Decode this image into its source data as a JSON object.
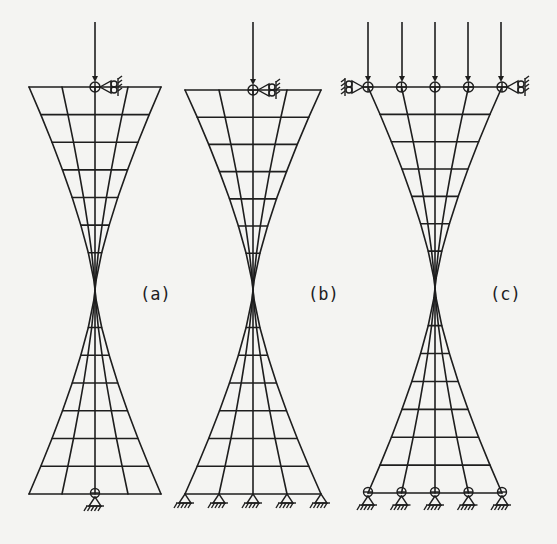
{
  "figure": {
    "panels": [
      {
        "id": "a",
        "label": "(a)",
        "center_x": 95,
        "top_y": 87,
        "waist_y": 290,
        "bottom_y": 494,
        "half_width_top": 66,
        "half_width_bottom": 66,
        "columns": 5,
        "rows_per_half": 7,
        "loads": [
          {
            "x": 95,
            "label": "point-load"
          }
        ],
        "top_support": "roller-right",
        "bottom_supports": "single-pin-center",
        "label_pos": [
          140,
          300
        ]
      },
      {
        "id": "b",
        "label": "(b)",
        "center_x": 253,
        "top_y": 90,
        "waist_y": 290,
        "bottom_y": 494,
        "half_width_top": 68,
        "half_width_bottom": 68,
        "columns": 5,
        "rows_per_half": 7,
        "loads": [
          {
            "x": 253,
            "label": "point-load"
          }
        ],
        "top_support": "roller-right",
        "bottom_supports": "fixed-pins-all-nodes",
        "label_pos": [
          308,
          300
        ]
      },
      {
        "id": "c",
        "label": "(c)",
        "center_x": 435,
        "top_y": 87,
        "waist_y": 288,
        "bottom_y": 493,
        "half_width_top": 67,
        "half_width_bottom": 67,
        "columns": 5,
        "rows_per_half": 7,
        "loads": [
          {
            "x": 368,
            "label": "distributed-load-1"
          },
          {
            "x": 402,
            "label": "distributed-load-2"
          },
          {
            "x": 435,
            "label": "distributed-load-3"
          },
          {
            "x": 468,
            "label": "distributed-load-4"
          },
          {
            "x": 501,
            "label": "distributed-load-5"
          }
        ],
        "top_support": "rollers-both-ends-with-hinges",
        "bottom_supports": "hinged-pins-all-nodes",
        "label_pos": [
          490,
          300
        ]
      }
    ],
    "load_top_y": 22,
    "colors": {
      "ink": "#1e1e1e",
      "paper": "#f4f4f2"
    }
  }
}
